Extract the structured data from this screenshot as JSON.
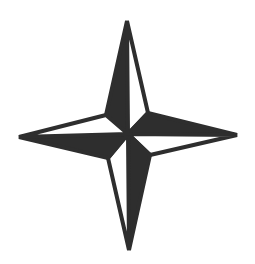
{
  "image": {
    "subject": "four-pointed compass star",
    "icon": "compass-star-icon",
    "colors": {
      "background": "#ffffff",
      "fill_dark": "#2e2e2e",
      "fill_light": "#ffffff",
      "stroke": "#2e2e2e"
    }
  }
}
